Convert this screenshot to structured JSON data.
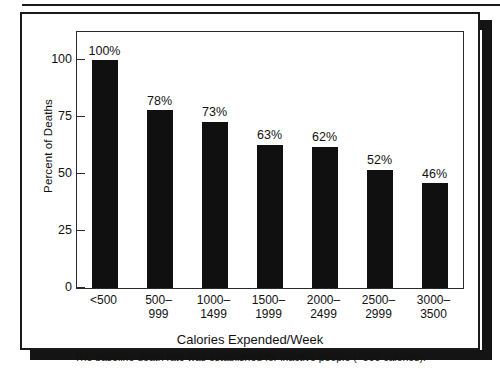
{
  "figure": {
    "frame_color": "#1a1a1a",
    "shadow_color": "#141414",
    "bar_color": "#101010",
    "background": "#ffffff"
  },
  "chart_data": {
    "type": "bar",
    "title": "",
    "subtitle": "",
    "xlabel": "Calories Expended/Week",
    "ylabel": "Percent of Deaths",
    "categories": [
      "<500",
      "500–999",
      "1000–1499",
      "1500–1999",
      "2000–2499",
      "2500–2999",
      "3000–3500"
    ],
    "category_lines": [
      {
        "line1": "<500",
        "line2": ""
      },
      {
        "line1": "500–",
        "line2": "999"
      },
      {
        "line1": "1000–",
        "line2": "1499"
      },
      {
        "line1": "1500–",
        "line2": "1999"
      },
      {
        "line1": "2000–",
        "line2": "2499"
      },
      {
        "line1": "2500–",
        "line2": "2999"
      },
      {
        "line1": "3000–",
        "line2": "3500"
      }
    ],
    "values": [
      100,
      78,
      73,
      63,
      62,
      52,
      46
    ],
    "data_labels": [
      "100%",
      "78%",
      "73%",
      "63%",
      "62%",
      "52%",
      "46%"
    ],
    "ylim": [
      0,
      112
    ],
    "yticks": [
      0,
      25,
      50,
      75,
      100
    ],
    "ytick_labels": [
      "0",
      "25",
      "50",
      "75",
      "100"
    ],
    "grid": false,
    "legend": null,
    "annotation": "The baseline death rate was established for inactive people (<500 calories)."
  },
  "caption": {
    "text": "The baseline death rate was established for inactive people (<500 calories)."
  }
}
